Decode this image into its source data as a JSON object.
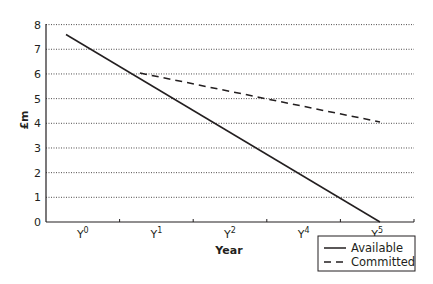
{
  "chart_data": {
    "type": "line",
    "title": "",
    "xlabel": "Year",
    "ylabel": "£m",
    "categories": [
      "Y0",
      "Y1",
      "Y2",
      "Y4",
      "Y5"
    ],
    "category_labels": [
      {
        "base": "Y",
        "sup": "0"
      },
      {
        "base": "Y",
        "sup": "1"
      },
      {
        "base": "Y",
        "sup": "2"
      },
      {
        "base": "Y",
        "sup": "4"
      },
      {
        "base": "Y",
        "sup": "5"
      }
    ],
    "ylim": [
      0,
      8
    ],
    "yticks": [
      "0",
      "1",
      "2",
      "3",
      "4",
      "5",
      "6",
      "7",
      "8"
    ],
    "grid": true,
    "legend_position": "bottom-right",
    "series": [
      {
        "name": "Available",
        "style": "solid",
        "values": [
          7.5,
          5.5,
          3.7,
          1.8,
          0
        ],
        "note": "straight line from 7.5 at Y0 to 0 at Y5"
      },
      {
        "name": "Committed",
        "style": "dashed",
        "values": [
          null,
          5.9,
          5.3,
          4.6,
          4.0
        ],
        "note": "dashed line from ~6 (where it meets Available, between Y0 and Y1) to 4 at Y5"
      }
    ],
    "colors": {
      "line": "#231f20",
      "grid": "#231f20",
      "background": "#ffffff"
    }
  }
}
